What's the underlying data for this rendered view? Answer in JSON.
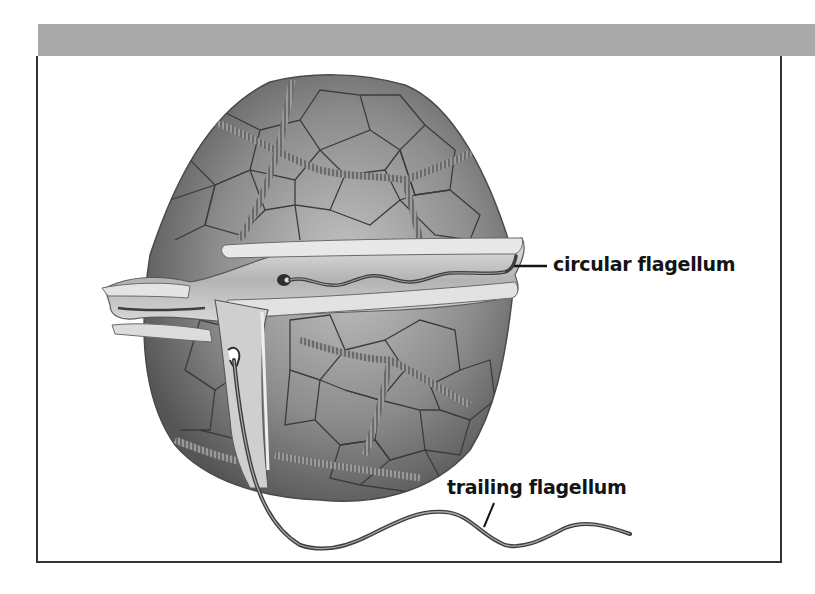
{
  "figure": {
    "labels": {
      "circular": "circular flagellum",
      "trailing": "trailing flagellum"
    }
  },
  "colors": {
    "header_bar": "#a9a9a9",
    "frame_border": "#333333",
    "cell_plate": "#8a8a8a",
    "plate_edges": "#3c3c3c",
    "girdle": "#c8c8c8",
    "label_text": "#141414"
  }
}
